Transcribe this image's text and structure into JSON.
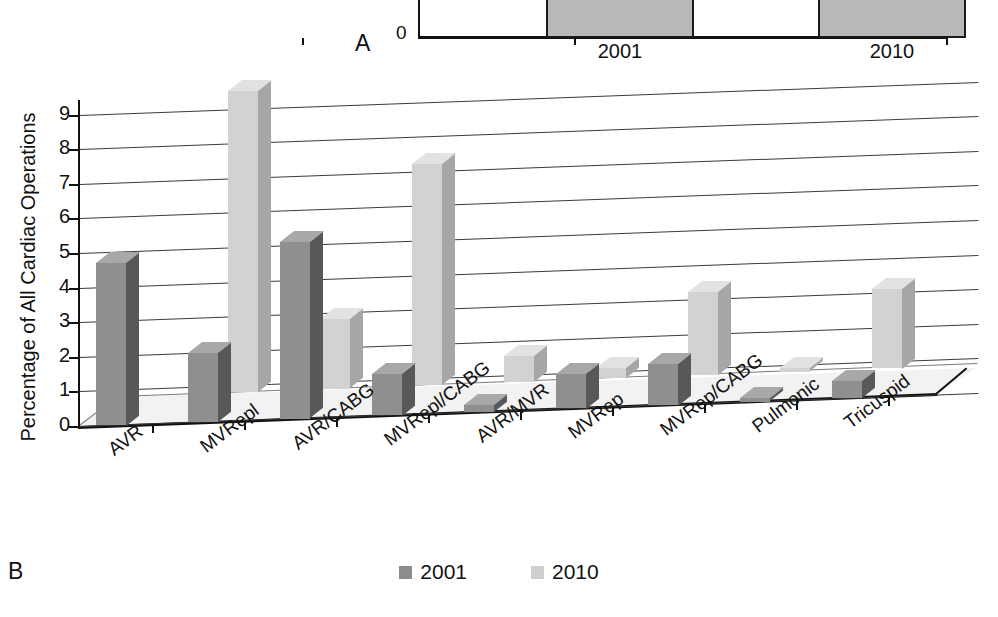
{
  "figure": {
    "panel_a": {
      "letter": "A",
      "zero_label": "0",
      "categories": [
        "2001",
        "2010"
      ],
      "values": [
        1,
        1
      ],
      "note": "top of panel A is cropped out of frame; only baseline, two bars and year labels are visible"
    },
    "panel_b": {
      "letter": "B"
    }
  },
  "legend": {
    "items": [
      {
        "label": "2001",
        "color": "#8c8c8c"
      },
      {
        "label": "2010",
        "color": "#cfcfcf"
      }
    ]
  },
  "colors": {
    "series_2001_front": "#8f8f8f",
    "series_2001_side": "#585858",
    "series_2001_top": "#a8a8a8",
    "series_2010_front": "#d2d2d2",
    "series_2010_side": "#a6a6a6",
    "series_2010_top": "#e2e2e2",
    "axis": "#111111",
    "gridline": "#3a3a3a",
    "floor": "#f2f2f2"
  },
  "chart_data": {
    "type": "bar",
    "title": "",
    "subtitle": "",
    "xlabel": "",
    "ylabel": "Percentage of All Cardiac Operations",
    "ylim": [
      0,
      9
    ],
    "yticks": [
      0,
      1,
      2,
      3,
      4,
      5,
      6,
      7,
      8,
      9
    ],
    "ytick_labels": [
      "0",
      "1",
      "2",
      "3",
      "4",
      "5",
      "6",
      "7",
      "8",
      "9"
    ],
    "grid": true,
    "projection": "3d",
    "legend_position": "bottom-center",
    "categories": [
      "AVR",
      "MVRepl",
      "AVR/CABG",
      "MVRepl/CABG",
      "AVR/MVR",
      "MVRep",
      "MVRep/CABG",
      "Pulmonic",
      "Tricuspid"
    ],
    "series": [
      {
        "name": "2001",
        "values": [
          4.7,
          2.0,
          5.1,
          1.2,
          0.2,
          1.0,
          1.2,
          0.1,
          0.5
        ]
      },
      {
        "name": "2010",
        "values": [
          0.0,
          8.7,
          2.0,
          6.4,
          0.75,
          0.3,
          2.4,
          0.1,
          2.3
        ]
      }
    ]
  }
}
